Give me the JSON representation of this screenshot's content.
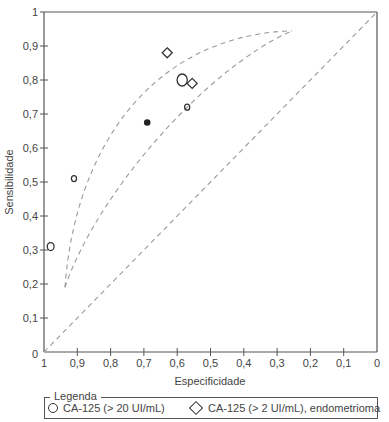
{
  "chart_data": {
    "type": "scatter",
    "title": "",
    "xlabel": "Especificidade",
    "ylabel": "Sensibilidade",
    "xlim": [
      1,
      0
    ],
    "ylim": [
      0,
      1
    ],
    "x_reversed": true,
    "grid": false,
    "x_ticks": [
      "1",
      "0,9",
      "0,8",
      "0,7",
      "0,6",
      "0,5",
      "0,4",
      "0,3",
      "0,2",
      "0,1",
      "0"
    ],
    "y_ticks": [
      "0",
      "0,1",
      "0,2",
      "0,3",
      "0,4",
      "0,5",
      "0,6",
      "0,7",
      "0,8",
      "0,9",
      "1"
    ],
    "series": [
      {
        "name": "CA-125 (> 20 UI/mL)",
        "marker": "circle",
        "points": [
          {
            "specificity": 0.98,
            "sensitivity": 0.31,
            "size": "medium"
          },
          {
            "specificity": 0.91,
            "sensitivity": 0.51,
            "size": "small"
          },
          {
            "specificity": 0.585,
            "sensitivity": 0.8,
            "size": "large"
          },
          {
            "specificity": 0.57,
            "sensitivity": 0.72,
            "size": "small"
          }
        ]
      },
      {
        "name": "CA-125 (> 2 UI/mL), endometrioma",
        "marker": "diamond",
        "points": [
          {
            "specificity": 0.63,
            "sensitivity": 0.88
          },
          {
            "specificity": 0.555,
            "sensitivity": 0.79
          }
        ]
      },
      {
        "name": "summary point",
        "marker": "filled-circle",
        "points": [
          {
            "specificity": 0.69,
            "sensitivity": 0.675
          }
        ]
      }
    ],
    "reference_lines": [
      {
        "name": "chance-diagonal",
        "style": "dashed",
        "from": [
          1,
          0
        ],
        "to": [
          0,
          1
        ]
      },
      {
        "name": "confidence-region-upper",
        "style": "dashed",
        "from": [
          0.937,
          0.19
        ],
        "to": [
          0.255,
          0.945
        ]
      },
      {
        "name": "confidence-region-lower",
        "style": "dashed",
        "from": [
          0.937,
          0.19
        ],
        "to": [
          0.255,
          0.945
        ]
      }
    ],
    "legend": {
      "title": "Legenda",
      "position": "bottom",
      "entries": [
        {
          "symbol": "circle",
          "label": "CA-125 (> 20 UI/mL)"
        },
        {
          "symbol": "diamond",
          "label": "CA-125 (> 2 UI/mL), endometrioma"
        }
      ]
    }
  },
  "labels": {
    "xlabel": "Especificidade",
    "ylabel": "Sensibilidade",
    "legend_title": "Legenda",
    "legend_circle": "CA-125 (> 20 UI/mL)",
    "legend_diamond": "CA-125 (> 2 UI/mL), endometrioma"
  },
  "colors": {
    "axis": "#555555",
    "dashed": "#9a9a9a",
    "marker": "#333333"
  }
}
